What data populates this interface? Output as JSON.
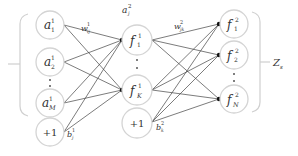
{
  "diagram": {
    "type": "neural-network",
    "input_layer": {
      "nodes": [
        {
          "id": "a1",
          "base": "a",
          "sub": "1",
          "sup": "1"
        },
        {
          "id": "a2",
          "base": "a",
          "sub": "2",
          "sup": "1"
        },
        {
          "id": "aM",
          "base": "a",
          "sub": "M",
          "sup": "1"
        }
      ],
      "bias": "+1",
      "weight_label": {
        "base": "w",
        "sub": "ij",
        "sup": "1"
      },
      "bias_label": {
        "base": "b",
        "sub": "j",
        "sup": "1"
      }
    },
    "hidden_layer": {
      "header_label": {
        "base": "a",
        "sub": "j",
        "sup": "2"
      },
      "nodes": [
        {
          "id": "fh1",
          "base": "f",
          "sub": "1",
          "sup": "1"
        },
        {
          "id": "fhK",
          "base": "f",
          "sub": "K",
          "sup": "1"
        }
      ],
      "bias": "+1",
      "weight_label": {
        "base": "w",
        "sub": "jk",
        "sup": "2"
      },
      "bias_label": {
        "base": "b",
        "sub": "k",
        "sup": "2"
      }
    },
    "output_layer": {
      "nodes": [
        {
          "id": "fo1",
          "base": "f",
          "sub": "1",
          "sup": "2"
        },
        {
          "id": "fo2",
          "base": "f",
          "sub": "2",
          "sup": "2"
        },
        {
          "id": "foN",
          "base": "f",
          "sub": "N",
          "sup": "2"
        }
      ],
      "group_label": {
        "base": "Z",
        "sub": "s"
      }
    },
    "colors": {
      "node_stroke": "#d4d4d4",
      "edge": "#444444",
      "bracket": "#cfcfcf",
      "text": "#333333"
    }
  }
}
